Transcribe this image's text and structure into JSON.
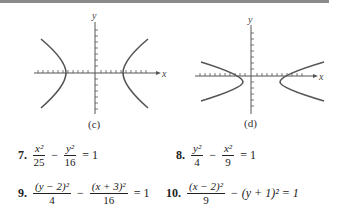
{
  "figures": [
    {
      "id": "c",
      "caption": "(c)",
      "x_label": "x",
      "y_label": "y",
      "description": "horizontal hyperbola centered at origin"
    },
    {
      "id": "d",
      "caption": "(d)",
      "x_label": "x",
      "y_label": "y",
      "description": "horizontal hyperbola with flatter branches, center slightly below x-axis"
    }
  ],
  "problems": [
    {
      "number": "7.",
      "lhs1_num": "x²",
      "lhs1_den": "25",
      "op": "−",
      "lhs2_num": "y²",
      "lhs2_den": "16",
      "rhs": "= 1"
    },
    {
      "number": "8.",
      "lhs1_num": "y²",
      "lhs1_den": "4",
      "op": "−",
      "lhs2_num": "x²",
      "lhs2_den": "9",
      "rhs": "= 1"
    },
    {
      "number": "9.",
      "lhs1_num": "(y − 2)²",
      "lhs1_den": "4",
      "op": "−",
      "lhs2_num": "(x + 3)²",
      "lhs2_den": "16",
      "rhs": "= 1"
    },
    {
      "number": "10.",
      "lhs1_num": "(x − 2)²",
      "lhs1_den": "9",
      "op": "−",
      "rest": "(y + 1)² = 1"
    }
  ]
}
